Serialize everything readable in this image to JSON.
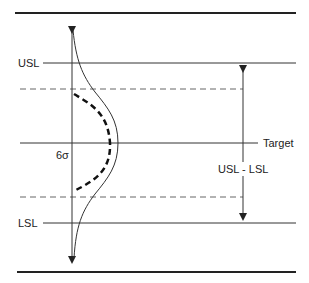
{
  "diagram": {
    "labels": {
      "usl": "USL",
      "lsl": "LSL",
      "target": "Target",
      "six_sigma": "6σ",
      "spec_width": "USL - LSL"
    },
    "colors": {
      "line": "#222222",
      "dashed": "#666666",
      "background": "#ffffff"
    },
    "elements": [
      {
        "id": "top-border",
        "type": "thick-line"
      },
      {
        "id": "usl-line",
        "type": "line",
        "label": "USL"
      },
      {
        "id": "upper-process-limit",
        "type": "dashed-line"
      },
      {
        "id": "target-line",
        "type": "line",
        "label": "Target"
      },
      {
        "id": "lower-process-limit",
        "type": "dashed-line"
      },
      {
        "id": "lsl-line",
        "type": "line",
        "label": "LSL"
      },
      {
        "id": "bottom-border",
        "type": "thick-line"
      },
      {
        "id": "axis-arrow",
        "type": "double-arrow"
      },
      {
        "id": "distribution-curve",
        "type": "solid-curve"
      },
      {
        "id": "six-sigma-curve",
        "type": "dashed-curve",
        "label": "6σ"
      },
      {
        "id": "spec-width-arrow",
        "type": "double-arrow",
        "label": "USL - LSL"
      }
    ]
  }
}
